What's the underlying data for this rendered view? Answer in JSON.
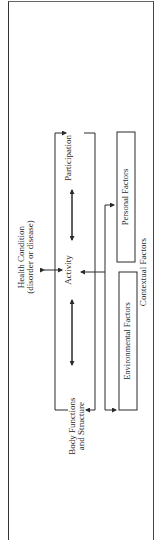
{
  "diagram": {
    "nodes": {
      "health_condition": {
        "line1": "Health Condition",
        "line2": "(disorder or disease)"
      },
      "body_functions": {
        "line1": "Body Functions",
        "line2": "and Structure"
      },
      "activity": {
        "label": "Activity"
      },
      "participation": {
        "label": "Participation"
      },
      "environmental_factors": {
        "label": "Environmental Factors"
      },
      "personal_factors": {
        "label": "Personal Factors"
      },
      "contextual_factors": {
        "label": "Contextual Factors"
      }
    },
    "edges": [
      {
        "from": "health_condition",
        "to": "activity",
        "type": "bidirectional"
      },
      {
        "from": "body_functions",
        "to": "activity",
        "type": "bidirectional"
      },
      {
        "from": "activity",
        "to": "participation",
        "type": "bidirectional"
      },
      {
        "from": "body_functions",
        "to": "participation",
        "type": "bidirectional-bracket"
      },
      {
        "from": "contextual_factors",
        "to": "activity",
        "type": "arrow"
      },
      {
        "from": "contextual_factors",
        "to": "environmental_factors",
        "type": "arrow"
      },
      {
        "from": "contextual_factors",
        "to": "personal_factors",
        "type": "arrow"
      }
    ],
    "orientation": "rotated 90deg counter-clockwise"
  },
  "margin_note": "",
  "colors": {
    "ink": "#2a2a2a",
    "background": "#ffffff"
  }
}
